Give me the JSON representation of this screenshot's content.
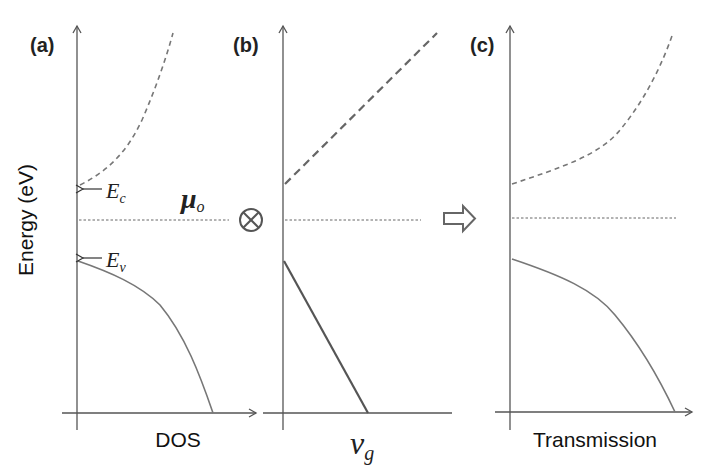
{
  "figure": {
    "y_axis_label": "Energy (eV)",
    "operator_symbol": "⊗",
    "panels": [
      {
        "id": "a",
        "label": "(a)",
        "x_axis_label": "DOS",
        "annotations": {
          "ec": {
            "main": "E",
            "sub": "c"
          },
          "ev": {
            "main": "E",
            "sub": "v"
          },
          "mu": {
            "main": "μ",
            "sub": "o"
          }
        },
        "curves": [
          {
            "name": "conduction-band-dos",
            "style": "dashed",
            "shape": "convex rising from Ec"
          },
          {
            "name": "valence-band-dos",
            "style": "solid",
            "shape": "concave falling from Ev"
          }
        ]
      },
      {
        "id": "b",
        "label": "(b)",
        "x_axis_label_main": "v",
        "x_axis_label_sub": "g",
        "curves": [
          {
            "name": "conduction-band-group-velocity",
            "style": "dashed-thick",
            "shape": "linear rising"
          },
          {
            "name": "valence-band-group-velocity",
            "style": "solid-thick",
            "shape": "linear falling"
          }
        ]
      },
      {
        "id": "c",
        "label": "(c)",
        "x_axis_label": "Transmission",
        "curves": [
          {
            "name": "conduction-band-transmission",
            "style": "dashed",
            "shape": "convex rising"
          },
          {
            "name": "valence-band-transmission",
            "style": "solid",
            "shape": "concave falling"
          }
        ]
      }
    ],
    "colors": {
      "axis": "#555555",
      "curve": "#777777",
      "text": "#222222",
      "background": "#ffffff"
    }
  }
}
